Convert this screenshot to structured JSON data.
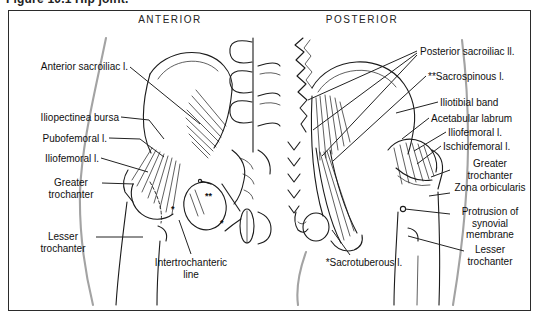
{
  "caption": "Figure 10.1   Hip joint.",
  "headers": {
    "anterior": "ANTERIOR",
    "posterior": "POSTERIOR"
  },
  "anterior": {
    "labels": [
      {
        "text": "Anterior sacroiliac l."
      },
      {
        "text": "Iliopectinea bursa"
      },
      {
        "text": "Pubofemoral l."
      },
      {
        "text": "Iliofemoral l."
      },
      {
        "text": "Greater trochanter"
      },
      {
        "text": "Lesser trochanter"
      },
      {
        "text": "Intertrochanteric line"
      }
    ]
  },
  "posterior": {
    "labels": [
      {
        "text": "Posterior sacroiliac ll."
      },
      {
        "text": "**Sacrospinous l."
      },
      {
        "text": "Iliotibial band"
      },
      {
        "text": "Acetabular labrum"
      },
      {
        "text": "Iliofemoral l."
      },
      {
        "text": "Ischiofemoral l."
      },
      {
        "text": "Greater trochanter"
      },
      {
        "text": "Zona orbicularis"
      },
      {
        "text": "Protrusion of synovial membrane"
      },
      {
        "text": "Lesser trochanter"
      },
      {
        "text": "*Sacrotuberous l."
      }
    ]
  },
  "figure_marks": {
    "sacrospinous_in_view": "**",
    "sacrotuberous_in_view_a": "*",
    "sacrotuberous_in_view_b": "*"
  },
  "colors": {
    "line": "#1b1b1b",
    "body_outline": "#a3a3a3",
    "frame_border": "#2b2b2b",
    "background": "#ffffff"
  }
}
